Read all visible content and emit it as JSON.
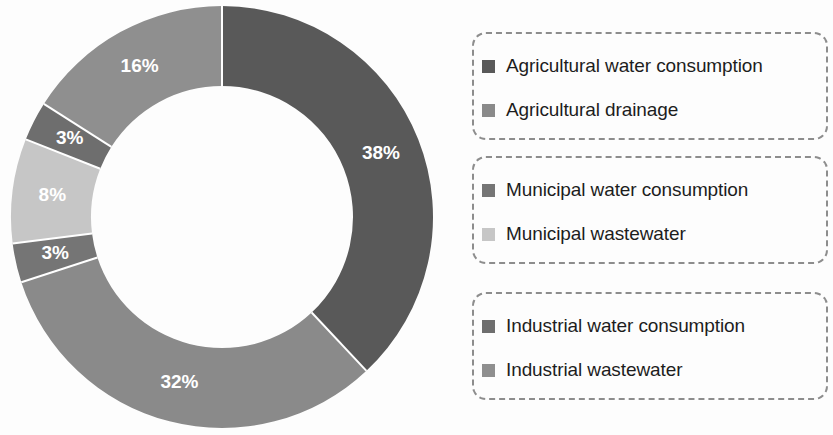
{
  "chart_data": {
    "type": "pie",
    "variant": "donut",
    "title": "",
    "subtitle": "",
    "xlabel": "",
    "ylabel": "",
    "grid": false,
    "legend_position": "right",
    "start_angle_deg": 0,
    "direction": "clockwise",
    "unit": "%",
    "categories": [
      "Agricultural water consumption",
      "Agricultural drainage",
      "Municipal water consumption",
      "Municipal wastewater",
      "Industrial water consumption",
      "Industrial wastewater"
    ],
    "values": [
      38,
      32,
      3,
      8,
      3,
      16
    ],
    "data_labels": [
      "38%",
      "32%",
      "3%",
      "8%",
      "3%",
      "16%"
    ],
    "colors": [
      "#595959",
      "#8a8a8a",
      "#757575",
      "#c6c6c6",
      "#6e6e6e",
      "#8f8f8f"
    ]
  },
  "chart": {
    "center_x": 222,
    "center_y": 217,
    "outer_radius": 211,
    "inner_radius": 131,
    "label_radius": 171,
    "slice_label_color": "#ffffff",
    "separator_color": "#ffffff"
  },
  "legend": {
    "border_color": "#8d8d8d",
    "groups": [
      {
        "name": "agricultural",
        "items": [
          {
            "label": "Agricultural water consumption",
            "color": "#595959"
          },
          {
            "label": "Agricultural drainage",
            "color": "#8a8a8a"
          }
        ]
      },
      {
        "name": "municipal",
        "items": [
          {
            "label": "Municipal water consumption",
            "color": "#757575"
          },
          {
            "label": "Municipal wastewater",
            "color": "#c6c6c6"
          }
        ]
      },
      {
        "name": "industrial",
        "items": [
          {
            "label": "Industrial water consumption",
            "color": "#6e6e6e"
          },
          {
            "label": "Industrial wastewater",
            "color": "#8f8f8f"
          }
        ]
      }
    ]
  }
}
